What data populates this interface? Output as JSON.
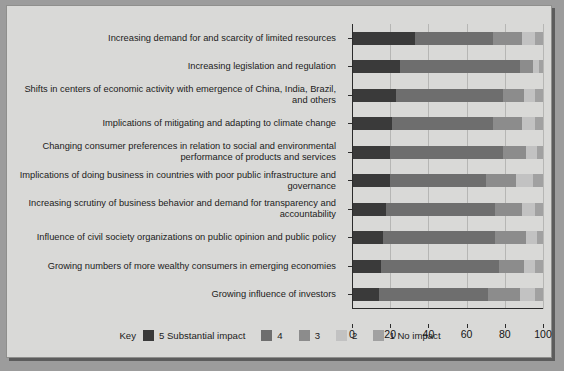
{
  "chart_data": {
    "type": "bar",
    "orientation": "horizontal",
    "stacked": true,
    "title": "",
    "xlabel": "",
    "ylabel": "",
    "xlim": [
      0,
      100
    ],
    "xticks": [
      0,
      20,
      40,
      60,
      80,
      100
    ],
    "xtick_labels": [
      "0",
      "20",
      "40",
      "60",
      "80",
      "100"
    ],
    "grid": true,
    "legend_position": "bottom",
    "categories": [
      "Increasing demand for and scarcity of limited resources",
      "Increasing legislation and regulation",
      "Shifts in centers of economic activity with emergence of China, India, Brazil, and others",
      "Implications of mitigating and adapting to climate change",
      "Changing consumer preferences in relation to social and environmental performance of products and services",
      "Implications of doing business in countries with poor public infrastructure and governance",
      "Increasing scrutiny of business behavior and demand for transparency and accountability",
      "Influence of civil society organizations on public opinion and public policy",
      "Growing numbers of more wealthy consumers in emerging economies",
      "Growing influence of investors"
    ],
    "series": [
      {
        "name": "5 Substantial impact",
        "color": "#3a3a3a",
        "values": [
          33,
          25,
          23,
          21,
          20,
          20,
          18,
          16,
          15,
          14
        ]
      },
      {
        "name": "4",
        "color": "#6e6e6e",
        "values": [
          41,
          63,
          56,
          53,
          59,
          50,
          57,
          59,
          62,
          57
        ]
      },
      {
        "name": "3",
        "color": "#8c8c8c",
        "values": [
          15,
          7,
          11,
          15,
          12,
          16,
          14,
          16,
          13,
          17
        ]
      },
      {
        "name": "2",
        "color": "#c2c2c2",
        "values": [
          7,
          3,
          6,
          7,
          6,
          9,
          7,
          6,
          6,
          8
        ]
      },
      {
        "name": "1 No impact",
        "color": "#a1a1a1",
        "values": [
          4,
          2,
          4,
          4,
          3,
          5,
          4,
          3,
          4,
          4
        ]
      }
    ]
  },
  "legend": {
    "key_word": "Key",
    "entries": [
      {
        "label": "5 Substantial impact",
        "color": "#3a3a3a"
      },
      {
        "label": "4",
        "color": "#6e6e6e"
      },
      {
        "label": "3",
        "color": "#8c8c8c"
      },
      {
        "label": "2",
        "color": "#c2c2c2"
      },
      {
        "label": "1 No impact",
        "color": "#a1a1a1"
      }
    ]
  }
}
